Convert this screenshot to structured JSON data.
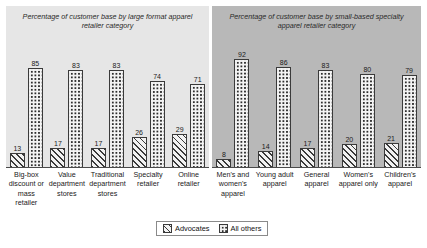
{
  "chart_data": {
    "type": "bar",
    "title": "",
    "xlabel": "",
    "ylabel": "",
    "ylim": [
      0,
      100
    ],
    "grid": false,
    "legend_position": "bottom-center",
    "legend": [
      "Advocates",
      "All others"
    ],
    "panels": [
      {
        "title": "Percentage of customer base by large format apparel retailer category",
        "categories": [
          "Big-box discount or mass retailer",
          "Value department stores",
          "Traditional department stores",
          "Specialty retailer",
          "Online retailer"
        ],
        "series": [
          {
            "name": "Advocates",
            "values": [
              13,
              17,
              17,
              26,
              29
            ]
          },
          {
            "name": "All others",
            "values": [
              85,
              83,
              83,
              74,
              71
            ]
          }
        ]
      },
      {
        "title": "Percentage of customer base by small-based specialty apparel retailer category",
        "categories": [
          "Men's and women's apparel",
          "Young adult apparel",
          "General apparel",
          "Women's apparel only",
          "Children's apparel"
        ],
        "series": [
          {
            "name": "Advocates",
            "values": [
              8,
              14,
              17,
              20,
              21
            ]
          },
          {
            "name": "All others",
            "values": [
              92,
              86,
              83,
              80,
              79
            ]
          }
        ]
      }
    ]
  },
  "panel_left": {
    "title": "Percentage of customer base by large format apparel retailer category",
    "categories": [
      "Big-box discount or mass retailer",
      "Value department stores",
      "Traditional department stores",
      "Specialty retailer",
      "Online retailer"
    ],
    "advocates": [
      "13",
      "17",
      "17",
      "26",
      "29"
    ],
    "all_others": [
      "85",
      "83",
      "83",
      "74",
      "71"
    ]
  },
  "panel_right": {
    "title": "Percentage of customer base by small-based specialty apparel retailer category",
    "categories": [
      "Men's and women's apparel",
      "Young adult apparel",
      "General apparel",
      "Women's apparel only",
      "Children's apparel"
    ],
    "advocates": [
      "8",
      "14",
      "17",
      "20",
      "21"
    ],
    "all_others": [
      "92",
      "86",
      "83",
      "80",
      "79"
    ]
  },
  "legend": {
    "advocates_label": "Advocates",
    "all_others_label": "All others"
  },
  "colors": {
    "panel_left_bg": "#e6e6e6",
    "panel_right_bg": "#b8b8b8",
    "bar_outline": "#3a3a3a",
    "page_bg": "#ffffff"
  }
}
